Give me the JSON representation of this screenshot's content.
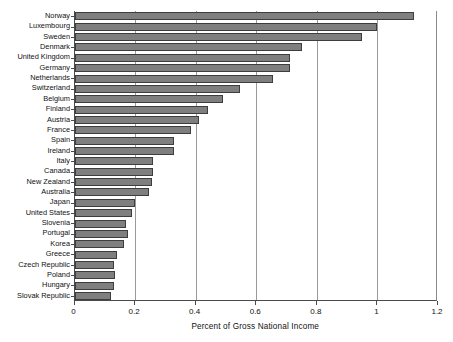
{
  "chart_data": {
    "type": "bar",
    "orientation": "horizontal",
    "title": "",
    "xlabel": "Percent of Gross National Income",
    "ylabel": "",
    "xlim": [
      0,
      1.2
    ],
    "xticks": [
      "0",
      "0.2",
      "0.4",
      "0.6",
      "0.8",
      "1",
      "1.2"
    ],
    "xtick_values": [
      0,
      0.2,
      0.4,
      0.6,
      0.8,
      1,
      1.2
    ],
    "grid": "vertical",
    "legend": "none",
    "bar_color": "#7f7f7f",
    "bar_edge_color": "#3d3d3d",
    "categories": [
      "Norway",
      "Luxembourg",
      "Sweden",
      "Denmark",
      "United Kingdom",
      "Germany",
      "Netherlands",
      "Switzerland",
      "Belgium",
      "Finland",
      "Austria",
      "France",
      "Spain",
      "Ireland",
      "Italy",
      "Canada",
      "New Zealand",
      "Australia",
      "Japan",
      "United States",
      "Slovenia",
      "Portugal",
      "Korea",
      "Greece",
      "Czech Republic",
      "Poland",
      "Hungary",
      "Slovak Republic"
    ],
    "values": [
      1.12,
      1.0,
      0.95,
      0.75,
      0.71,
      0.71,
      0.655,
      0.545,
      0.49,
      0.44,
      0.41,
      0.385,
      0.33,
      0.33,
      0.26,
      0.26,
      0.255,
      0.245,
      0.2,
      0.19,
      0.17,
      0.175,
      0.165,
      0.14,
      0.13,
      0.135,
      0.13,
      0.12
    ]
  }
}
